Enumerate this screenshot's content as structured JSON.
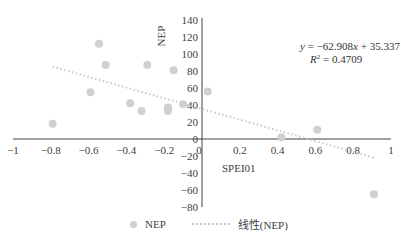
{
  "chart_data": {
    "type": "scatter",
    "title": "",
    "xlabel": "SPEI01",
    "ylabel": "NEP",
    "xlim": [
      -1,
      1
    ],
    "ylim": [
      -80,
      140
    ],
    "x_ticks": [
      "-1",
      "-0.8",
      "-0.6",
      "-0.4",
      "-0.2",
      "0",
      "0.2",
      "0.4",
      "0.6",
      "0.8",
      "1"
    ],
    "y_ticks": [
      "140",
      "120",
      "100",
      "80",
      "60",
      "40",
      "20",
      "0",
      "-20",
      "-40",
      "-60",
      "-80"
    ],
    "grid": false,
    "legend_position": "bottom",
    "series": [
      {
        "name": "NEP",
        "type": "scatter",
        "color": "#d0d0d0",
        "points": [
          {
            "x": -0.79,
            "y": 18
          },
          {
            "x": -0.59,
            "y": 55
          },
          {
            "x": -0.545,
            "y": 112
          },
          {
            "x": -0.51,
            "y": 87
          },
          {
            "x": -0.38,
            "y": 42
          },
          {
            "x": -0.32,
            "y": 33
          },
          {
            "x": -0.29,
            "y": 87
          },
          {
            "x": -0.18,
            "y": 37
          },
          {
            "x": -0.18,
            "y": 33
          },
          {
            "x": -0.15,
            "y": 81
          },
          {
            "x": -0.1,
            "y": 41
          },
          {
            "x": 0.03,
            "y": 56
          },
          {
            "x": 0.42,
            "y": 2
          },
          {
            "x": 0.61,
            "y": 11
          },
          {
            "x": 0.91,
            "y": -65
          }
        ]
      },
      {
        "name": "线性(NEP)",
        "type": "line",
        "style": "dotted",
        "color": "#c8c8c8",
        "slope": -62.908,
        "intercept": 35.337,
        "x_range": [
          -0.79,
          0.91
        ]
      }
    ],
    "annotations": {
      "equation": "y = −62.908x + 35.337",
      "r_squared": "R² = 0.4709"
    }
  },
  "legend": {
    "items": [
      {
        "label": "NEP"
      },
      {
        "label": "线性(NEP)"
      }
    ]
  }
}
